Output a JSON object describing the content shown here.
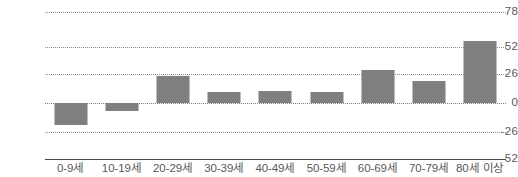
{
  "chart_data": {
    "type": "bar",
    "title": "",
    "xlabel": "",
    "ylabel": "",
    "categories": [
      "0-9세",
      "10-19세",
      "20-29세",
      "30-39세",
      "40-49세",
      "50-59세",
      "60-69세",
      "70-79세",
      "80세 이상"
    ],
    "values": [
      -20,
      -7,
      24,
      10,
      11,
      10,
      30,
      20,
      56
    ],
    "ylim": [
      -52,
      78
    ],
    "yticks": [
      78,
      52,
      26,
      0,
      -26,
      -52
    ],
    "ytick_labels": [
      "78",
      "52",
      "26",
      "0",
      "-26",
      "-52"
    ],
    "grid": true,
    "legend": false,
    "bar_color": "#7f7f7f",
    "gridline_color": "#8d8d8f",
    "axis_color": "#4a4a4c",
    "label_color": "#58585a"
  }
}
